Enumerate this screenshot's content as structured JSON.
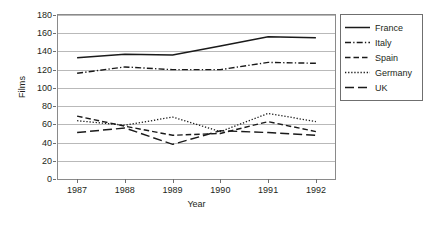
{
  "chart_data": {
    "type": "line",
    "title": "",
    "xlabel": "Year",
    "ylabel": "Films",
    "x": [
      1987,
      1988,
      1989,
      1990,
      1991,
      1992
    ],
    "xticklabels": [
      "1987",
      "1988",
      "1989",
      "1990",
      "1991",
      "1992"
    ],
    "yticklabels": [
      "0",
      "20",
      "40",
      "60",
      "80",
      "100",
      "120",
      "140",
      "160",
      "180"
    ],
    "yticks": [
      0,
      20,
      40,
      60,
      80,
      100,
      120,
      140,
      160,
      180
    ],
    "ylim": [
      0,
      180
    ],
    "xlim": [
      1986.6,
      1992.4
    ],
    "grid": "horizontal",
    "legend_position": "right-outside",
    "series": [
      {
        "name": "France",
        "style": "solid",
        "color": "#1a1a1a",
        "values": [
          133,
          137,
          136,
          146,
          156,
          155
        ]
      },
      {
        "name": "Italy",
        "style": "dash-dot",
        "color": "#1a1a1a",
        "values": [
          116,
          123,
          120,
          120,
          128,
          127
        ]
      },
      {
        "name": "Spain",
        "style": "dashed",
        "color": "#1a1a1a",
        "values": [
          69,
          58,
          48,
          50,
          63,
          52
        ]
      },
      {
        "name": "Germany",
        "style": "dotted",
        "color": "#1a1a1a",
        "values": [
          64,
          59,
          68,
          52,
          72,
          63
        ]
      },
      {
        "name": "UK",
        "style": "long-dash",
        "color": "#1a1a1a",
        "values": [
          51,
          56,
          38,
          53,
          51,
          48
        ]
      }
    ]
  },
  "legend": {
    "items": [
      {
        "label": "France"
      },
      {
        "label": "Italy"
      },
      {
        "label": "Spain"
      },
      {
        "label": "Germany"
      },
      {
        "label": "UK"
      }
    ]
  },
  "axes": {
    "y_title": "Films",
    "x_title": "Year"
  }
}
